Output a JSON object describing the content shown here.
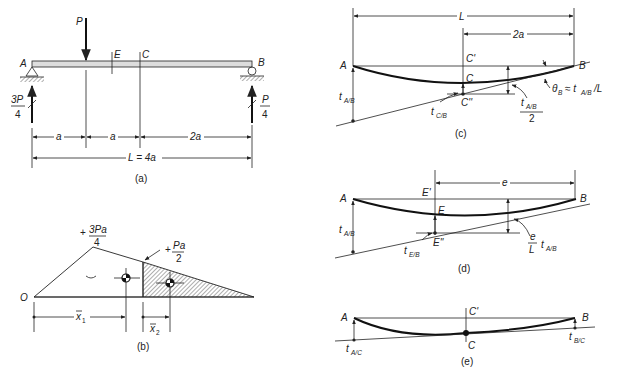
{
  "figure_a": {
    "caption": "(a)",
    "load": "P",
    "support_left": "A",
    "support_right": "B",
    "point_e": "E",
    "point_c": "C",
    "reaction_left_num": "3P",
    "reaction_left_den": "4",
    "reaction_right_num": "P",
    "reaction_right_den": "4",
    "dim_1": "a",
    "dim_2": "a",
    "dim_3": "2a",
    "dim_total": "L = 4a"
  },
  "figure_b": {
    "caption": "(b)",
    "origin": "O",
    "peak_sign": "+",
    "peak_num": "3Pa",
    "peak_den": "4",
    "mid_sign": "+",
    "mid_num": "Pa",
    "mid_den": "2",
    "xbar1": "x",
    "xbar1_sub": "1",
    "xbar2": "x",
    "xbar2_sub": "2"
  },
  "figure_c": {
    "caption": "(c)",
    "span": "L",
    "dim": "2a",
    "left": "A",
    "right": "B",
    "c_prime": "C'",
    "c": "C",
    "c_dprime": "C''",
    "t_ab": "t",
    "t_ab_sub": "A/B",
    "t_cb": "t",
    "t_cb_sub": "C/B",
    "half_num": "t",
    "half_num_sub": "A/B",
    "half_den": "2",
    "theta": "θ",
    "theta_sub": "B",
    "theta_expr": "≈ t",
    "theta_expr_sub": "A/B",
    "theta_tail": "/L"
  },
  "figure_d": {
    "caption": "(d)",
    "dim": "e",
    "left": "A",
    "right": "B",
    "e_prime": "E'",
    "e": "E",
    "e_dprime": "E''",
    "t_ab": "t",
    "t_ab_sub": "A/B",
    "t_eb": "t",
    "t_eb_sub": "E/B",
    "ratio_num": "e",
    "ratio_den": "L",
    "ratio_t": "t",
    "ratio_t_sub": "A/B"
  },
  "figure_e": {
    "caption": "(e)",
    "left": "A",
    "right": "B",
    "c_prime": "C'",
    "c": "C",
    "t_ac": "t",
    "t_ac_sub": "A/C",
    "t_bc": "t",
    "t_bc_sub": "B/C"
  }
}
